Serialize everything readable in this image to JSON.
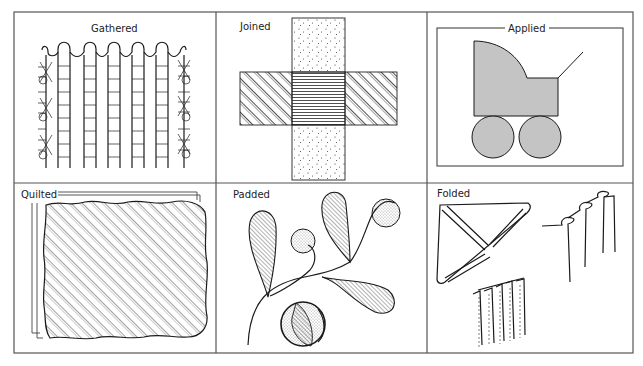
{
  "diagram": {
    "type": "illustration-grid",
    "layout": {
      "columns": 3,
      "rows": 2
    },
    "colors": {
      "ink": "#1a1a1a",
      "fill_grey": "#c4c4c4",
      "background": "#ffffff"
    },
    "panels": [
      {
        "id": "gathered",
        "label": "Gathered",
        "description": "vertical gathered fabric columns with ladder stitching and smocking-style side stitches"
      },
      {
        "id": "joined",
        "label": "Joined",
        "description": "cross of a dotted vertical strip and a diagonally hatched horizontal strip with horizontal-lined overlap"
      },
      {
        "id": "applied",
        "label": "Applied",
        "description": "grey pram silhouette appliqué with two wheels inside a framed rectangle"
      },
      {
        "id": "quilted",
        "label": "Quilted",
        "description": "layered square with wavy edges and diagonal quilting lines"
      },
      {
        "id": "padded",
        "label": "Padded",
        "description": "curving stems with hatched teardrop leaves, stippled round berries and a hatched ball"
      },
      {
        "id": "folded",
        "label": "Folded",
        "description": "folded triangle, stepped folded pleats and a row of stitched folds"
      }
    ]
  }
}
